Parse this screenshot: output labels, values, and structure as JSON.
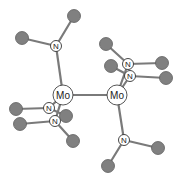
{
  "diagram": {
    "type": "ball-and-stick molecular structure",
    "colors": {
      "bond": "#7a7a7a",
      "carbon_fill": "#808080",
      "nitrogen_fill": "#ffffff",
      "molybdenum_fill": "#ffffff"
    },
    "metals": [
      {
        "id": "mo1",
        "label": "Mo",
        "x": 63,
        "y": 95,
        "r": 10
      },
      {
        "id": "mo2",
        "label": "Mo",
        "x": 117,
        "y": 95,
        "r": 10
      }
    ],
    "nitrogens": [
      {
        "id": "n1",
        "label": "N",
        "x": 56,
        "y": 46,
        "metal": "mo1"
      },
      {
        "id": "n2",
        "label": "N",
        "x": 49,
        "y": 108,
        "metal": "mo1"
      },
      {
        "id": "n3",
        "label": "N",
        "x": 55,
        "y": 121,
        "metal": "mo1"
      },
      {
        "id": "n4",
        "label": "N",
        "x": 128,
        "y": 64,
        "metal": "mo2"
      },
      {
        "id": "n5",
        "label": "N",
        "x": 130,
        "y": 76,
        "metal": "mo2"
      },
      {
        "id": "n6",
        "label": "N",
        "x": 124,
        "y": 140,
        "metal": "mo2"
      }
    ],
    "carbons": [
      {
        "id": "c1",
        "x": 22,
        "y": 38,
        "n": "n1"
      },
      {
        "id": "c2",
        "x": 74,
        "y": 16,
        "n": "n1"
      },
      {
        "id": "c3",
        "x": 16,
        "y": 109,
        "n": "n2"
      },
      {
        "id": "c4",
        "x": 66,
        "y": 116,
        "n": "n2"
      },
      {
        "id": "c5",
        "x": 20,
        "y": 124,
        "n": "n3"
      },
      {
        "id": "c6",
        "x": 73,
        "y": 141,
        "n": "n3"
      },
      {
        "id": "c7",
        "x": 106,
        "y": 44,
        "n": "n4"
      },
      {
        "id": "c8",
        "x": 162,
        "y": 63,
        "n": "n4"
      },
      {
        "id": "c9",
        "x": 111,
        "y": 66,
        "n": "n5"
      },
      {
        "id": "c10",
        "x": 166,
        "y": 78,
        "n": "n5"
      },
      {
        "id": "c11",
        "x": 158,
        "y": 148,
        "n": "n6"
      },
      {
        "id": "c12",
        "x": 108,
        "y": 166,
        "n": "n6"
      }
    ]
  }
}
